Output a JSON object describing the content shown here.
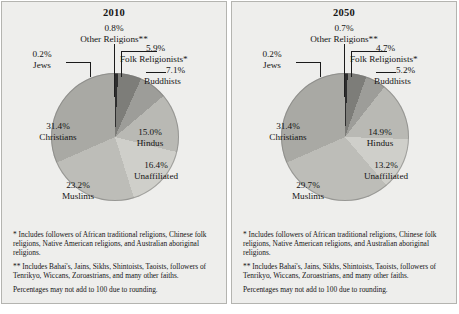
{
  "panels": [
    {
      "title": "2010",
      "labels": {
        "other_pct": "0.8%",
        "other_name": "Other Religions**",
        "jews_pct": "0.2%",
        "jews_name": "Jews",
        "folk_pct": "5.9%",
        "folk_name": "Folk Religionists*",
        "budd_pct": "7.1%",
        "budd_name": "Buddhists",
        "chr_pct": "31.4%",
        "chr_name": "Christians",
        "hin_pct": "15.0%",
        "hin_name": "Hindus",
        "una_pct": "16.4%",
        "una_name": "Unaffiliated",
        "mus_pct": "23.2%",
        "mus_name": "Muslims"
      },
      "notes": [
        "* Includes followers of African traditional religions, Chinese folk religions, Native American religions, and Australian aboriginal religions.",
        "** Includes Bahai's, Jains, Sikhs, Shintoists, Taoists, followers of Tenrikyo, Wiccans, Zoroastrians, and many other faiths.",
        "Percentages may not add to 100 due to rounding."
      ]
    },
    {
      "title": "2050",
      "labels": {
        "other_pct": "0.7%",
        "other_name": "Other Religions**",
        "jews_pct": "0.2%",
        "jews_name": "Jews",
        "folk_pct": "4.7%",
        "folk_name": "Folk Religionists*",
        "budd_pct": "5.2%",
        "budd_name": "Buddhists",
        "chr_pct": "31.4%",
        "chr_name": "Christians",
        "hin_pct": "14.9%",
        "hin_name": "Hindus",
        "una_pct": "13.2%",
        "una_name": "Unaffiliated",
        "mus_pct": "29.7%",
        "mus_name": "Muslims"
      },
      "notes": [
        "* Includes followers of African traditional religions, Chinese folk religions, Native American religions, and Australian aboriginal religions.",
        "** Includes Bahai's, Jains, Sikhs, Shintoists, Taoists, followers of Tenrikyo, Wiccans, Zoroastrians, and many other faiths.",
        "Percentages may not add to 100 due to rounding."
      ]
    }
  ],
  "chart_data": [
    {
      "type": "pie",
      "title": "2010",
      "start_angle_deg": 0,
      "direction": "clockwise",
      "categories": [
        "Other Religions**",
        "Folk Religionists*",
        "Buddhists",
        "Hindus",
        "Unaffiliated",
        "Muslims",
        "Christians",
        "Jews"
      ],
      "values": [
        0.8,
        5.9,
        7.1,
        15.0,
        16.4,
        23.2,
        31.4,
        0.2
      ],
      "colors": [
        "#2e2e2e",
        "#7d7d79",
        "#9d9d99",
        "#b9b9b4",
        "#cfcfca",
        "#bdbdb8",
        "#a9a9a4",
        "#1f1f1f"
      ],
      "legend": "none",
      "grid": false
    },
    {
      "type": "pie",
      "title": "2050",
      "start_angle_deg": 0,
      "direction": "clockwise",
      "categories": [
        "Other Religions**",
        "Folk Religionists*",
        "Buddhists",
        "Hindus",
        "Unaffiliated",
        "Muslims",
        "Christians",
        "Jews"
      ],
      "values": [
        0.7,
        4.7,
        5.2,
        14.9,
        13.2,
        29.7,
        31.4,
        0.2
      ],
      "colors": [
        "#2e2e2e",
        "#7d7d79",
        "#9d9d99",
        "#b9b9b4",
        "#cfcfca",
        "#bdbdb8",
        "#a9a9a4",
        "#1f1f1f"
      ],
      "legend": "none",
      "grid": false
    }
  ]
}
